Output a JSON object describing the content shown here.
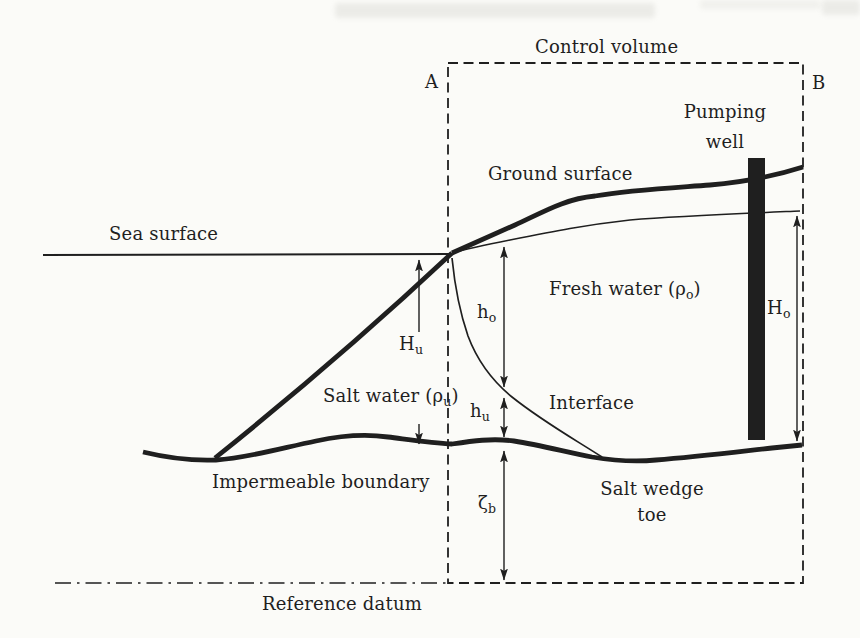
{
  "figure": {
    "colors": {
      "ink": "#1f1f1f",
      "paper": "#fbfbf8"
    },
    "labels": {
      "control_volume": "Control volume",
      "corner_a": "A",
      "corner_b": "B",
      "pumping_well": {
        "line1": "Pumping",
        "line2": "well"
      },
      "ground_surface": "Ground surface",
      "sea_surface": "Sea surface",
      "fresh_water": {
        "pre": "Fresh water (ρ",
        "sub": "o",
        "post": ")"
      },
      "salt_water": {
        "pre": "Salt water (ρ",
        "sub": "u",
        "post": ")"
      },
      "interface": "Interface",
      "impermeable_boundary": "Impermeable boundary",
      "salt_wedge_toe": {
        "line1": "Salt wedge",
        "line2": "toe"
      },
      "reference_datum": "Reference datum",
      "dim_Hu": {
        "base": "H",
        "sub": "u"
      },
      "dim_ho": {
        "base": "h",
        "sub": "o"
      },
      "dim_hu": {
        "base": "h",
        "sub": "u"
      },
      "dim_zeta_b": {
        "base": "ζ",
        "sub": "b"
      },
      "dim_Ho": {
        "base": "H",
        "sub": "o"
      }
    }
  }
}
